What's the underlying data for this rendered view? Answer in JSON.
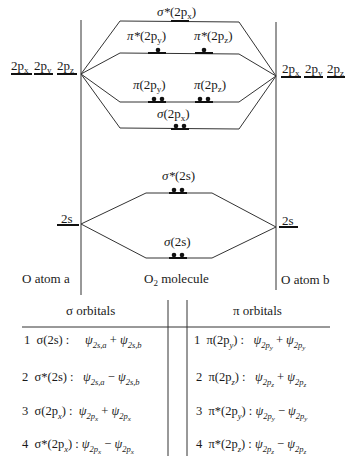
{
  "diagram": {
    "atom_a_label": "O atom a",
    "atom_b_label": "O atom b",
    "molecule_label_main": "O",
    "molecule_label_sub": "2",
    "molecule_label_rest": " molecule",
    "atom_a_levels": {
      "p": [
        {
          "main": "2p",
          "sub": "x"
        },
        {
          "main": "2p",
          "sub": "y"
        },
        {
          "main": "2p",
          "sub": "z"
        }
      ],
      "s": "2s"
    },
    "atom_b_levels": {
      "p": [
        {
          "main": "2p",
          "sub": "x"
        },
        {
          "main": "2p",
          "sub": "y"
        },
        {
          "main": "2p",
          "sub": "z"
        }
      ],
      "s": "2s"
    },
    "mo_levels": [
      {
        "id": "sigma_star_2px",
        "greek": "σ*",
        "main": "(2p",
        "sub": "x",
        "close": ")",
        "electrons": 0
      },
      {
        "id": "pi_star_2py",
        "greek": "π*",
        "main": "(2p",
        "sub": "y",
        "close": ")",
        "electrons": 1
      },
      {
        "id": "pi_star_2pz",
        "greek": "π*",
        "main": "(2p",
        "sub": "z",
        "close": ")",
        "electrons": 1
      },
      {
        "id": "pi_2py",
        "greek": "π",
        "main": "(2p",
        "sub": "y",
        "close": ")",
        "electrons": 2
      },
      {
        "id": "pi_2pz",
        "greek": "π",
        "main": "(2p",
        "sub": "z",
        "close": ")",
        "electrons": 2
      },
      {
        "id": "sigma_2px",
        "greek": "σ",
        "main": "(2p",
        "sub": "x",
        "close": ")",
        "electrons": 2
      },
      {
        "id": "sigma_star_2s",
        "greek": "σ*",
        "main": "(2s)",
        "sub": "",
        "close": "",
        "electrons": 2
      },
      {
        "id": "sigma_2s",
        "greek": "σ",
        "main": "(2s)",
        "sub": "",
        "close": "",
        "electrons": 2
      }
    ]
  },
  "table": {
    "sigma_header": "σ orbitals",
    "pi_header": "π orbitals",
    "sigma_rows": [
      {
        "num": "1",
        "name": "σ(2s) :",
        "psi": "ψ",
        "t1": "2s,a",
        "op": " + ",
        "t2": "2s,b"
      },
      {
        "num": "2",
        "name": "σ*(2s) :",
        "psi": "ψ",
        "t1": "2s,a",
        "op": " − ",
        "t2": "2s,b"
      },
      {
        "num": "3",
        "name": "σ(2p",
        "nsub": "x",
        "nclose": ") :",
        "psi": "ψ",
        "t1": "2p",
        "t1s": "x",
        "op": " + ",
        "t2": "2p",
        "t2s": "x"
      },
      {
        "num": "4",
        "name": "σ*(2p",
        "nsub": "x",
        "nclose": ") :",
        "psi": "ψ",
        "t1": "2p",
        "t1s": "x",
        "op": " − ",
        "t2": "2p",
        "t2s": "x"
      }
    ],
    "pi_rows": [
      {
        "num": "1",
        "name": "π(2p",
        "nsub": "y",
        "nclose": ") :",
        "psi": "ψ",
        "t1": "2p",
        "t1s": "y",
        "op": " + ",
        "t2": "2p",
        "t2s": "y"
      },
      {
        "num": "2",
        "name": "π(2p",
        "nsub": "z",
        "nclose": ") :",
        "psi": "ψ",
        "t1": "2p",
        "t1s": "z",
        "op": " + ",
        "t2": "2p",
        "t2s": "z"
      },
      {
        "num": "3",
        "name": "π*(2p",
        "nsub": "y",
        "nclose": ") :",
        "psi": "ψ",
        "t1": "2p",
        "t1s": "y",
        "op": " − ",
        "t2": "2p",
        "t2s": "y"
      },
      {
        "num": "4",
        "name": "π*(2p",
        "nsub": "z",
        "nclose": ") :",
        "psi": "ψ",
        "t1": "2p",
        "t1s": "z",
        "op": " − ",
        "t2": "2p",
        "t2s": "z"
      }
    ]
  },
  "colors": {
    "ink": "#1a1a1a",
    "line": "#333333"
  }
}
